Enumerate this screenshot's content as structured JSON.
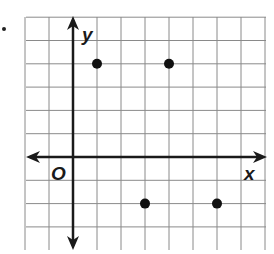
{
  "chart_data": {
    "type": "scatter",
    "title": "",
    "xlabel": "x",
    "ylabel": "y",
    "origin_label": "O",
    "grid": true,
    "xlim": [
      -2,
      8
    ],
    "ylim": [
      -4,
      6
    ],
    "points": [
      {
        "x": 1,
        "y": 4
      },
      {
        "x": 4,
        "y": 4
      },
      {
        "x": 3,
        "y": -2
      },
      {
        "x": 6,
        "y": -2
      }
    ],
    "colors": {
      "grid": "#8a8a8a",
      "axis": "#1a1a1a",
      "point": "#111111"
    }
  },
  "labels": {
    "x_axis": "x",
    "y_axis": "y",
    "origin": "O"
  }
}
